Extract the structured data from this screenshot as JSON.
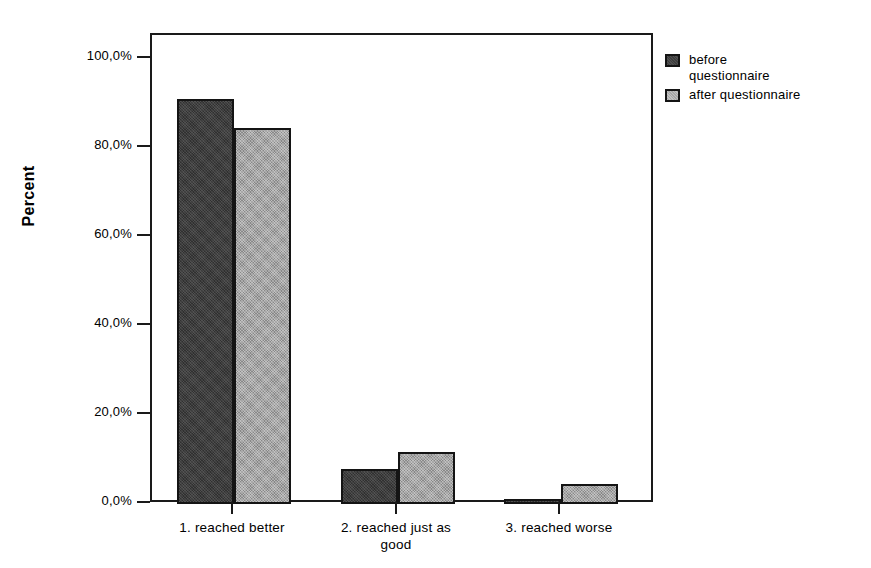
{
  "chart_data": {
    "type": "bar",
    "title": "",
    "xlabel": "",
    "ylabel": "Percent",
    "ylim": [
      0,
      100
    ],
    "grid": false,
    "legend_position": "right-top",
    "categories": [
      "1. reached better",
      "2. reached just as good",
      "3. reached worse"
    ],
    "series": [
      {
        "name": "before questionnaire",
        "values": [
          91.0,
          7.9,
          1.1
        ],
        "color": "#3d3d3d"
      },
      {
        "name": "after questionnaire",
        "values": [
          84.5,
          11.7,
          4.5
        ],
        "color": "#a6a6a6"
      }
    ],
    "y_ticks": [
      {
        "value": 0,
        "label": "0,0%"
      },
      {
        "value": 20,
        "label": "20,0%"
      },
      {
        "value": 40,
        "label": "40,0%"
      },
      {
        "value": 60,
        "label": "60,0%"
      },
      {
        "value": 80,
        "label": "80,0%"
      },
      {
        "value": 100,
        "label": "100,0%"
      }
    ],
    "x_tick_labels": [
      "1. reached better",
      "2. reached just as\ngood",
      "3. reached worse"
    ]
  },
  "axis": {
    "y_title": "Percent"
  },
  "legend": {
    "entries": [
      {
        "label": "before\nquestionnaire"
      },
      {
        "label": "after questionnaire"
      }
    ]
  }
}
